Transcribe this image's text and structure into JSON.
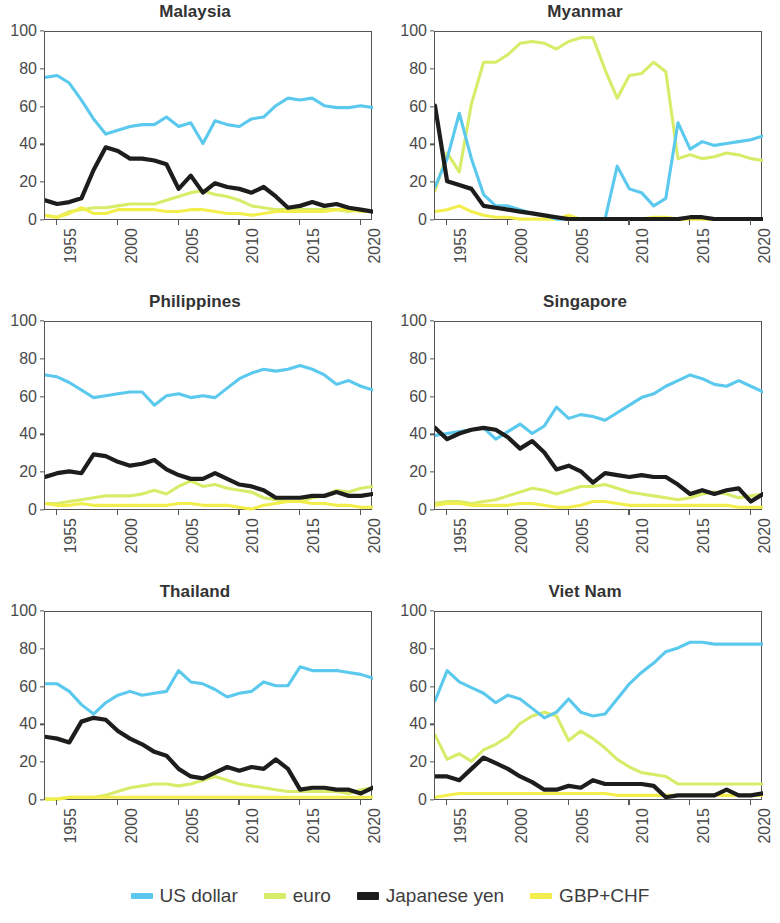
{
  "figure": {
    "background": "#ffffff",
    "panel_title_color": "#333333",
    "axis_color": "#555555"
  },
  "legend": {
    "position": "bottom-center",
    "items": [
      {
        "label": "US dollar",
        "color": "#5bc9ee",
        "weight": "normal"
      },
      {
        "label": "euro",
        "color": "#d9ec6a",
        "weight": "normal"
      },
      {
        "label": "Japanese yen",
        "color": "#1d1d1b",
        "weight": "thick"
      },
      {
        "label": "GBP+CHF",
        "color": "#f2ee4b",
        "weight": "normal"
      }
    ]
  },
  "axes": {
    "y_ticks": [
      0,
      20,
      40,
      60,
      80,
      100
    ],
    "ylim": [
      0,
      100
    ],
    "x_ticks": [
      "1955",
      "2000",
      "2005",
      "2010",
      "2015",
      "2020"
    ],
    "x_tick_values": [
      1995,
      2000,
      2005,
      2010,
      2015,
      2020
    ],
    "xlim": [
      1994,
      2021
    ],
    "grid": false,
    "xlabel": "",
    "ylabel": ""
  },
  "chart_data": [
    {
      "type": "line",
      "title": "Malaysia",
      "xlabel": "",
      "ylabel": "",
      "ylim": [
        0,
        100
      ],
      "xlim": [
        1994,
        2021
      ],
      "x": [
        1994,
        1995,
        1996,
        1997,
        1998,
        1999,
        2000,
        2001,
        2002,
        2003,
        2004,
        2005,
        2006,
        2007,
        2008,
        2009,
        2010,
        2011,
        2012,
        2013,
        2014,
        2015,
        2016,
        2017,
        2018,
        2019,
        2020,
        2021
      ],
      "series": [
        {
          "name": "US dollar",
          "color": "#5bc9ee",
          "values": [
            76,
            77,
            73,
            64,
            54,
            46,
            48,
            50,
            51,
            51,
            55,
            50,
            52,
            41,
            53,
            51,
            50,
            54,
            55,
            61,
            65,
            64,
            65,
            61,
            60,
            60,
            61,
            60
          ]
        },
        {
          "name": "euro",
          "color": "#d9ec6a",
          "values": [
            3,
            2,
            5,
            6,
            7,
            7,
            8,
            9,
            9,
            9,
            11,
            13,
            15,
            16,
            14,
            13,
            11,
            8,
            7,
            6,
            6,
            6,
            6,
            6,
            6,
            5,
            6,
            5
          ]
        },
        {
          "name": "Japanese yen",
          "color": "#1d1d1b",
          "values": [
            11,
            9,
            10,
            12,
            27,
            39,
            37,
            33,
            33,
            32,
            30,
            17,
            24,
            15,
            20,
            18,
            17,
            15,
            18,
            13,
            7,
            8,
            10,
            8,
            9,
            7,
            6,
            5
          ]
        },
        {
          "name": "GBP+CHF",
          "color": "#f2ee4b",
          "values": [
            3,
            2,
            4,
            7,
            4,
            4,
            6,
            6,
            6,
            6,
            5,
            5,
            6,
            6,
            5,
            4,
            4,
            3,
            4,
            5,
            5,
            5,
            5,
            5,
            6,
            6,
            5,
            5
          ]
        }
      ]
    },
    {
      "type": "line",
      "title": "Myanmar",
      "xlabel": "",
      "ylabel": "",
      "ylim": [
        0,
        100
      ],
      "xlim": [
        1994,
        2021
      ],
      "x": [
        1994,
        1995,
        1996,
        1997,
        1998,
        1999,
        2000,
        2001,
        2002,
        2003,
        2004,
        2005,
        2006,
        2007,
        2008,
        2009,
        2010,
        2011,
        2012,
        2013,
        2014,
        2015,
        2016,
        2017,
        2018,
        2019,
        2020,
        2021
      ],
      "series": [
        {
          "name": "US dollar",
          "color": "#5bc9ee",
          "values": [
            18,
            33,
            57,
            33,
            14,
            8,
            8,
            6,
            4,
            3,
            1,
            1,
            1,
            1,
            1,
            29,
            17,
            15,
            8,
            12,
            52,
            38,
            42,
            40,
            41,
            42,
            43,
            45
          ]
        },
        {
          "name": "euro",
          "color": "#d9ec6a",
          "values": [
            16,
            36,
            26,
            62,
            84,
            84,
            88,
            94,
            95,
            94,
            91,
            95,
            97,
            97,
            80,
            65,
            77,
            78,
            84,
            79,
            33,
            35,
            33,
            34,
            36,
            35,
            33,
            32
          ]
        },
        {
          "name": "Japanese yen",
          "color": "#1d1d1b",
          "values": [
            61,
            21,
            19,
            17,
            8,
            7,
            6,
            5,
            4,
            3,
            2,
            1,
            1,
            1,
            1,
            1,
            1,
            1,
            1,
            1,
            1,
            2,
            2,
            1,
            1,
            1,
            1,
            1
          ]
        },
        {
          "name": "GBP+CHF",
          "color": "#f2ee4b",
          "values": [
            5,
            6,
            8,
            5,
            3,
            2,
            2,
            1,
            1,
            1,
            1,
            3,
            1,
            1,
            1,
            1,
            1,
            1,
            2,
            2,
            1,
            1,
            1,
            1,
            1,
            1,
            1,
            1
          ]
        }
      ]
    },
    {
      "type": "line",
      "title": "Philippines",
      "xlabel": "",
      "ylabel": "",
      "ylim": [
        0,
        100
      ],
      "xlim": [
        1994,
        2021
      ],
      "x": [
        1994,
        1995,
        1996,
        1997,
        1998,
        1999,
        2000,
        2001,
        2002,
        2003,
        2004,
        2005,
        2006,
        2007,
        2008,
        2009,
        2010,
        2011,
        2012,
        2013,
        2014,
        2015,
        2016,
        2017,
        2018,
        2019,
        2020,
        2021
      ],
      "series": [
        {
          "name": "US dollar",
          "color": "#5bc9ee",
          "values": [
            72,
            71,
            68,
            64,
            60,
            61,
            62,
            63,
            63,
            56,
            61,
            62,
            60,
            61,
            60,
            65,
            70,
            73,
            75,
            74,
            75,
            77,
            75,
            72,
            67,
            69,
            66,
            64
          ]
        },
        {
          "name": "euro",
          "color": "#d9ec6a",
          "values": [
            4,
            4,
            5,
            6,
            7,
            8,
            8,
            8,
            9,
            11,
            9,
            13,
            16,
            13,
            14,
            12,
            11,
            10,
            7,
            6,
            5,
            5,
            7,
            8,
            11,
            10,
            12,
            13
          ]
        },
        {
          "name": "Japanese yen",
          "color": "#1d1d1b",
          "values": [
            18,
            20,
            21,
            20,
            30,
            29,
            26,
            24,
            25,
            27,
            22,
            19,
            17,
            17,
            20,
            17,
            14,
            13,
            11,
            7,
            7,
            7,
            8,
            8,
            10,
            8,
            8,
            9
          ]
        },
        {
          "name": "GBP+CHF",
          "color": "#f2ee4b",
          "values": [
            4,
            3,
            3,
            4,
            3,
            3,
            3,
            3,
            3,
            3,
            3,
            4,
            4,
            3,
            3,
            3,
            2,
            1,
            3,
            4,
            5,
            5,
            4,
            4,
            3,
            3,
            2,
            2
          ]
        }
      ]
    },
    {
      "type": "line",
      "title": "Singapore",
      "xlabel": "",
      "ylabel": "",
      "ylim": [
        0,
        100
      ],
      "xlim": [
        1994,
        2021
      ],
      "x": [
        1994,
        1995,
        1996,
        1997,
        1998,
        1999,
        2000,
        2001,
        2002,
        2003,
        2004,
        2005,
        2006,
        2007,
        2008,
        2009,
        2010,
        2011,
        2012,
        2013,
        2014,
        2015,
        2016,
        2017,
        2018,
        2019,
        2020,
        2021
      ],
      "series": [
        {
          "name": "US dollar",
          "color": "#5bc9ee",
          "values": [
            40,
            41,
            42,
            43,
            44,
            38,
            42,
            46,
            41,
            45,
            55,
            49,
            51,
            50,
            48,
            52,
            56,
            60,
            62,
            66,
            69,
            72,
            70,
            67,
            66,
            69,
            66,
            63
          ]
        },
        {
          "name": "euro",
          "color": "#d9ec6a",
          "values": [
            4,
            5,
            5,
            4,
            5,
            6,
            8,
            10,
            12,
            11,
            9,
            11,
            13,
            13,
            14,
            12,
            10,
            9,
            8,
            7,
            6,
            7,
            9,
            10,
            9,
            7,
            8,
            9
          ]
        },
        {
          "name": "Japanese yen",
          "color": "#1d1d1b",
          "values": [
            44,
            38,
            41,
            43,
            44,
            43,
            39,
            33,
            37,
            31,
            22,
            24,
            21,
            15,
            20,
            19,
            18,
            19,
            18,
            18,
            14,
            9,
            11,
            9,
            11,
            12,
            5,
            9
          ]
        },
        {
          "name": "GBP+CHF",
          "color": "#f2ee4b",
          "values": [
            3,
            4,
            4,
            3,
            3,
            3,
            3,
            4,
            4,
            3,
            2,
            2,
            3,
            5,
            5,
            4,
            3,
            3,
            3,
            3,
            3,
            3,
            3,
            3,
            3,
            2,
            2,
            2
          ]
        }
      ]
    },
    {
      "type": "line",
      "title": "Thailand",
      "xlabel": "",
      "ylabel": "",
      "ylim": [
        0,
        100
      ],
      "xlim": [
        1994,
        2021
      ],
      "x": [
        1994,
        1995,
        1996,
        1997,
        1998,
        1999,
        2000,
        2001,
        2002,
        2003,
        2004,
        2005,
        2006,
        2007,
        2008,
        2009,
        2010,
        2011,
        2012,
        2013,
        2014,
        2015,
        2016,
        2017,
        2018,
        2019,
        2020,
        2021
      ],
      "series": [
        {
          "name": "US dollar",
          "color": "#5bc9ee",
          "values": [
            62,
            62,
            58,
            51,
            46,
            52,
            56,
            58,
            56,
            57,
            58,
            69,
            63,
            62,
            59,
            55,
            57,
            58,
            63,
            61,
            61,
            71,
            69,
            69,
            69,
            68,
            67,
            65
          ]
        },
        {
          "name": "euro",
          "color": "#d9ec6a",
          "values": [
            1,
            1,
            2,
            2,
            2,
            3,
            5,
            7,
            8,
            9,
            9,
            8,
            9,
            11,
            13,
            11,
            9,
            8,
            7,
            6,
            5,
            5,
            5,
            5,
            5,
            4,
            6,
            7
          ]
        },
        {
          "name": "Japanese yen",
          "color": "#1d1d1b",
          "values": [
            34,
            33,
            31,
            42,
            44,
            43,
            37,
            33,
            30,
            26,
            24,
            17,
            13,
            12,
            15,
            18,
            16,
            18,
            17,
            22,
            17,
            6,
            7,
            7,
            6,
            6,
            4,
            7
          ]
        },
        {
          "name": "GBP+CHF",
          "color": "#f2ee4b",
          "values": [
            1,
            1,
            2,
            2,
            2,
            2,
            2,
            2,
            2,
            2,
            2,
            2,
            2,
            2,
            2,
            2,
            2,
            2,
            2,
            2,
            2,
            2,
            2,
            2,
            2,
            2,
            2,
            2
          ]
        }
      ]
    },
    {
      "type": "line",
      "title": "Viet Nam",
      "xlabel": "",
      "ylabel": "",
      "ylim": [
        0,
        100
      ],
      "xlim": [
        1994,
        2021
      ],
      "x": [
        1994,
        1995,
        1996,
        1997,
        1998,
        1999,
        2000,
        2001,
        2002,
        2003,
        2004,
        2005,
        2006,
        2007,
        2008,
        2009,
        2010,
        2011,
        2012,
        2013,
        2014,
        2015,
        2016,
        2017,
        2018,
        2019,
        2020,
        2021
      ],
      "series": [
        {
          "name": "US dollar",
          "color": "#5bc9ee",
          "values": [
            53,
            69,
            63,
            60,
            57,
            52,
            56,
            54,
            49,
            44,
            47,
            54,
            47,
            45,
            46,
            54,
            62,
            68,
            73,
            79,
            81,
            84,
            84,
            83,
            83,
            83,
            83,
            83
          ]
        },
        {
          "name": "euro",
          "color": "#d9ec6a",
          "values": [
            35,
            22,
            25,
            21,
            27,
            30,
            34,
            41,
            45,
            47,
            45,
            32,
            37,
            33,
            28,
            22,
            18,
            15,
            14,
            13,
            9,
            9,
            9,
            9,
            9,
            9,
            9,
            9
          ]
        },
        {
          "name": "Japanese yen",
          "color": "#1d1d1b",
          "values": [
            13,
            13,
            11,
            17,
            23,
            20,
            17,
            13,
            10,
            6,
            6,
            8,
            7,
            11,
            9,
            9,
            9,
            9,
            8,
            2,
            3,
            3,
            3,
            3,
            6,
            3,
            3,
            4
          ]
        },
        {
          "name": "GBP+CHF",
          "color": "#f2ee4b",
          "values": [
            2,
            3,
            4,
            4,
            4,
            4,
            4,
            4,
            4,
            4,
            4,
            4,
            4,
            4,
            4,
            3,
            3,
            3,
            3,
            3,
            3,
            3,
            3,
            3,
            3,
            3,
            3,
            3
          ]
        }
      ]
    }
  ]
}
